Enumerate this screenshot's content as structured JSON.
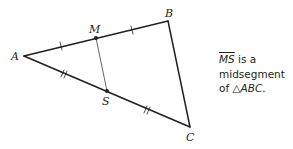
{
  "diagram": {
    "type": "geometry-triangle",
    "points": {
      "A": {
        "label": "A",
        "x": 24,
        "y": 56
      },
      "B": {
        "label": "B",
        "x": 168,
        "y": 21
      },
      "C": {
        "label": "C",
        "x": 190,
        "y": 127
      },
      "M": {
        "label": "M",
        "x": 96,
        "y": 38
      },
      "S": {
        "label": "S",
        "x": 107,
        "y": 91
      }
    },
    "segments": [
      "AB",
      "BC",
      "CA",
      "MS"
    ],
    "congruence_marks": {
      "AM": "single",
      "MB": "single",
      "AS": "double",
      "SC": "double"
    }
  },
  "caption": {
    "segment": "MS",
    "line1_rest": " is a",
    "line2": "midsegment",
    "line3_prefix": "of ",
    "triangle_symbol": "△",
    "triangle_name": "ABC",
    "line3_suffix": "."
  }
}
